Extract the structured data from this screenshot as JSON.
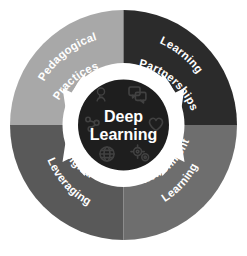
{
  "diagram": {
    "center": {
      "line1": "Deep",
      "line2": "Learning",
      "background_color": "#1e1e1e",
      "text_color": "#ffffff"
    },
    "ring_gap_color": "#ffffff",
    "background_color": "#ffffff",
    "quadrants": [
      {
        "id": "pedagogical-practices",
        "position": "top-left",
        "line1": "Pedagogical",
        "line2": "Practices",
        "color": "#a8a8a8",
        "text_color": "#ffffff"
      },
      {
        "id": "learning-partnerships",
        "position": "top-right",
        "line1": "Learning",
        "line2": "Partnerships",
        "color": "#2b2b2b",
        "text_color": "#ffffff"
      },
      {
        "id": "leveraging-digital",
        "position": "bottom-left",
        "line1": "Leveraging",
        "line2": "Digital",
        "color": "#595959",
        "text_color": "#ffffff"
      },
      {
        "id": "learning-environments",
        "position": "bottom-right",
        "line1": "Learning",
        "line2": "Environments",
        "color": "#6e6e6e",
        "text_color": "#ffffff"
      }
    ],
    "arrows": {
      "count": 4,
      "color": "#ffffff",
      "direction": "inward",
      "names": [
        "arrow-top-left",
        "arrow-top-right",
        "arrow-bottom-right",
        "arrow-bottom-left"
      ]
    },
    "center_icons": [
      "lightbulb-person-icon",
      "speech-bubbles-icon",
      "heart-icon",
      "gears-icon",
      "globe-icon",
      "network-nodes-icon"
    ]
  }
}
